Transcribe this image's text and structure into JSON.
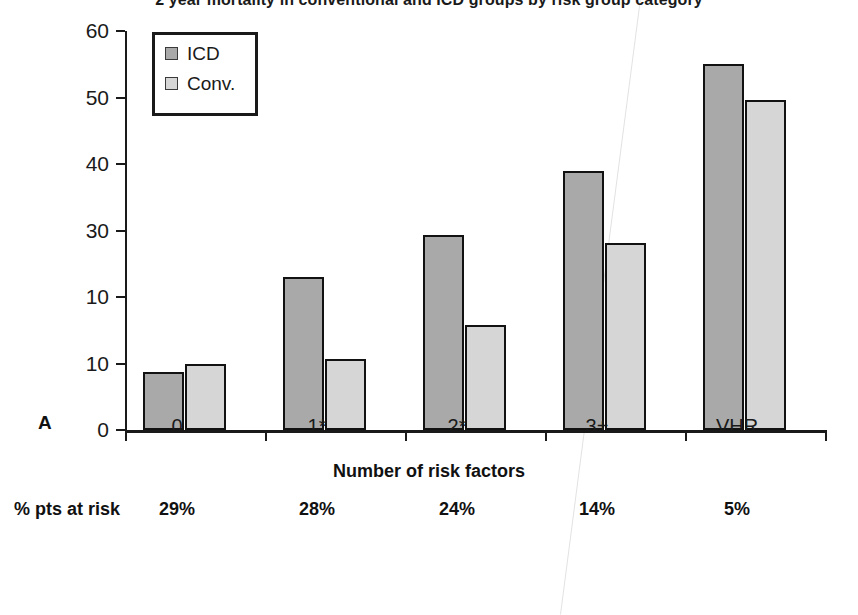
{
  "chart_data": {
    "type": "bar",
    "title": "2 year mortality in conventional and ICD groups by risk group category",
    "xlabel": "Number of risk factors",
    "ylabel": "",
    "categories": [
      "0",
      "1*",
      "2*",
      "3+",
      "VHR"
    ],
    "series": [
      {
        "name": "ICD",
        "values": [
          8.7,
          23.0,
          29.3,
          39.0,
          55.0
        ]
      },
      {
        "name": "Conv.",
        "values": [
          9.9,
          10.7,
          15.8,
          28.1,
          49.6
        ]
      }
    ],
    "ylim": [
      0,
      60
    ],
    "ytick_values": [
      0,
      10,
      20,
      30,
      40,
      50,
      60
    ],
    "ytick_labels": [
      "0",
      "10",
      "10",
      "30",
      "40",
      "50",
      "60"
    ],
    "grid": false,
    "legend_position": "top-left",
    "annotations": {
      "panel_label": "A",
      "risk_row_label": "% pts at risk",
      "risk_row_values": [
        "29%",
        "28%",
        "24%",
        "14%",
        "5%"
      ]
    },
    "colors": {
      "icd": "#a9a9a9",
      "conv": "#d6d6d6",
      "outline": "#121212",
      "background": "#ffffff"
    }
  },
  "legend": {
    "items": [
      {
        "label": "ICD"
      },
      {
        "label": "Conv."
      }
    ]
  }
}
